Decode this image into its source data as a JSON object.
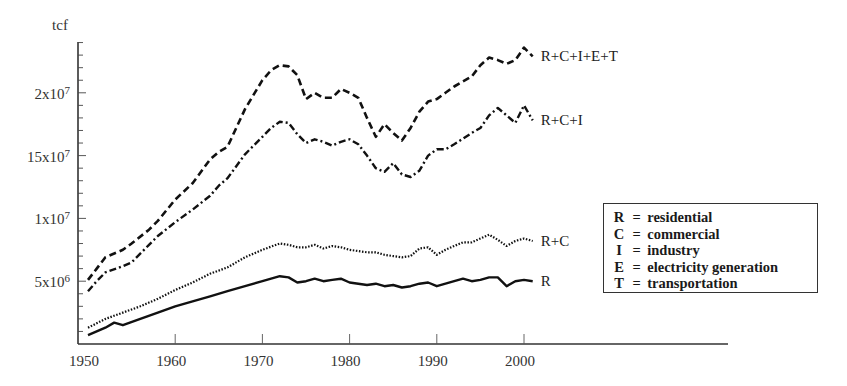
{
  "chart_data": {
    "type": "line",
    "title": "",
    "xlabel": "",
    "ylabel": "tcf",
    "xlim": [
      1950,
      2018
    ],
    "ylim": [
      0,
      24000000
    ],
    "grid": false,
    "legend_position": "right-center box",
    "x_ticks": [
      1950,
      1960,
      1970,
      1980,
      1990,
      2000
    ],
    "x_tick_labels": [
      "1950",
      "1960",
      "1970",
      "1980",
      "1990",
      "2000"
    ],
    "y_ticks": [
      5000000,
      10000000,
      15000000,
      20000000
    ],
    "y_tick_labels": [
      "5x10^6",
      "1x10^7",
      "15x10^7",
      "2x10^7"
    ],
    "series": [
      {
        "name": "R+C+I+E+T",
        "label": "R+C+I+E+T",
        "style": "dashed",
        "x": [
          1950,
          1951,
          1952,
          1954,
          1955,
          1957,
          1958,
          1960,
          1962,
          1964,
          1965,
          1966,
          1968,
          1970,
          1971,
          1972,
          1973,
          1974,
          1975,
          1976,
          1977,
          1978,
          1979,
          1980,
          1981,
          1982,
          1983,
          1984,
          1985,
          1986,
          1987,
          1988,
          1989,
          1990,
          1991,
          1992,
          1994,
          1995,
          1996,
          1997,
          1998,
          1999,
          2000,
          2001
        ],
        "values": [
          5100000,
          6000000,
          6900000,
          7500000,
          8000000,
          9100000,
          9800000,
          11500000,
          12800000,
          14700000,
          15300000,
          15700000,
          18700000,
          21000000,
          21800000,
          22200000,
          22100000,
          21400000,
          19500000,
          20000000,
          19600000,
          19600000,
          20300000,
          20000000,
          19600000,
          18000000,
          16500000,
          17500000,
          16800000,
          16200000,
          17200000,
          18500000,
          19300000,
          19500000,
          20000000,
          20500000,
          21300000,
          22200000,
          22800000,
          22600000,
          22300000,
          22600000,
          23600000,
          22900000
        ]
      },
      {
        "name": "R+C+I",
        "label": "R+C+I",
        "style": "dashdot",
        "x": [
          1950,
          1951,
          1952,
          1954,
          1955,
          1957,
          1958,
          1960,
          1962,
          1964,
          1965,
          1966,
          1968,
          1970,
          1971,
          1972,
          1973,
          1974,
          1975,
          1976,
          1977,
          1978,
          1979,
          1980,
          1981,
          1982,
          1983,
          1984,
          1985,
          1986,
          1987,
          1988,
          1989,
          1990,
          1991,
          1992,
          1994,
          1995,
          1996,
          1997,
          1998,
          1999,
          2000,
          2001
        ],
        "values": [
          4200000,
          5000000,
          5700000,
          6200000,
          6500000,
          7900000,
          8600000,
          9700000,
          10700000,
          11800000,
          12600000,
          13200000,
          15100000,
          16500000,
          17200000,
          17700000,
          17600000,
          16700000,
          16000000,
          16300000,
          16100000,
          15800000,
          16100000,
          16300000,
          15900000,
          15000000,
          14000000,
          13700000,
          14400000,
          13500000,
          13300000,
          13800000,
          15000000,
          15500000,
          15500000,
          15900000,
          16800000,
          17200000,
          18200000,
          18800000,
          18200000,
          17600000,
          19000000,
          17800000
        ]
      },
      {
        "name": "R+C",
        "label": "R+C",
        "style": "dotted",
        "x": [
          1950,
          1952,
          1954,
          1956,
          1958,
          1960,
          1962,
          1964,
          1966,
          1968,
          1970,
          1972,
          1973,
          1974,
          1975,
          1976,
          1977,
          1978,
          1979,
          1980,
          1981,
          1982,
          1983,
          1984,
          1985,
          1986,
          1987,
          1988,
          1989,
          1990,
          1991,
          1992,
          1993,
          1994,
          1995,
          1996,
          1997,
          1998,
          1999,
          2000,
          2001
        ],
        "values": [
          1300000,
          2000000,
          2500000,
          3000000,
          3600000,
          4300000,
          4900000,
          5600000,
          6100000,
          6900000,
          7500000,
          8000000,
          7900000,
          7700000,
          7700000,
          7900000,
          7600000,
          7800000,
          7700000,
          7500000,
          7400000,
          7300000,
          7300000,
          7100000,
          7000000,
          6900000,
          7000000,
          7600000,
          7700000,
          7100000,
          7500000,
          7800000,
          8100000,
          8100000,
          8400000,
          8700000,
          8300000,
          7800000,
          8200000,
          8400000,
          8200000
        ]
      },
      {
        "name": "R",
        "label": "R",
        "style": "solid",
        "x": [
          1950,
          1952,
          1953,
          1954,
          1956,
          1958,
          1960,
          1962,
          1964,
          1966,
          1968,
          1970,
          1972,
          1973,
          1974,
          1975,
          1976,
          1977,
          1978,
          1979,
          1980,
          1981,
          1982,
          1983,
          1984,
          1985,
          1986,
          1987,
          1988,
          1989,
          1990,
          1991,
          1992,
          1993,
          1994,
          1995,
          1996,
          1997,
          1998,
          1999,
          2000,
          2001
        ],
        "values": [
          700000,
          1300000,
          1700000,
          1500000,
          2000000,
          2500000,
          3000000,
          3400000,
          3800000,
          4200000,
          4600000,
          5000000,
          5400000,
          5300000,
          4900000,
          5000000,
          5200000,
          5000000,
          5100000,
          5200000,
          4900000,
          4800000,
          4700000,
          4800000,
          4600000,
          4700000,
          4500000,
          4600000,
          4800000,
          4900000,
          4600000,
          4800000,
          5000000,
          5200000,
          5000000,
          5100000,
          5300000,
          5300000,
          4600000,
          5000000,
          5100000,
          5000000
        ]
      }
    ],
    "legend": [
      {
        "key": "R",
        "desc": "residential"
      },
      {
        "key": "C",
        "desc": "commercial"
      },
      {
        "key": "I",
        "desc": "industry"
      },
      {
        "key": "E",
        "desc": "electricity generation"
      },
      {
        "key": "T",
        "desc": "transportation"
      }
    ]
  },
  "axis": {
    "y_unit": "tcf",
    "y_labels": [
      {
        "base": "2x10",
        "exp": "7",
        "value": 20000000
      },
      {
        "base": "15x10",
        "exp": "7",
        "value": 15000000
      },
      {
        "base": "1x10",
        "exp": "7",
        "value": 10000000
      },
      {
        "base": "5x10",
        "exp": "6",
        "value": 5000000
      }
    ],
    "x_labels": [
      "1950",
      "1960",
      "1970",
      "1980",
      "1990",
      "2000"
    ]
  },
  "legend": {
    "rows": [
      {
        "key": "R",
        "eq": "=",
        "desc": "residential"
      },
      {
        "key": "C",
        "eq": "=",
        "desc": "commercial"
      },
      {
        "key": "I",
        "eq": "=",
        "desc": "industry"
      },
      {
        "key": "E",
        "eq": "=",
        "desc": "electricity generation"
      },
      {
        "key": "T",
        "eq": "=",
        "desc": "transportation"
      }
    ]
  },
  "colors": {
    "line": "#111111",
    "axis": "#333333",
    "text": "#222222",
    "background": "#ffffff"
  }
}
